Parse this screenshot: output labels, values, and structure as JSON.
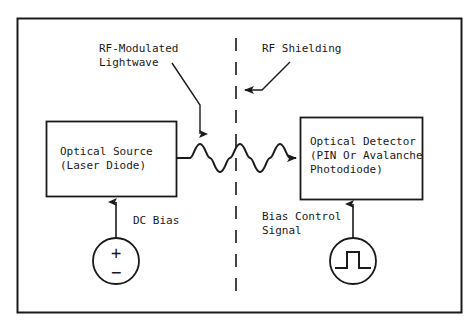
{
  "figure": {
    "type": "block-diagram",
    "frame": {
      "name": "outer-border",
      "color": "#1a1a1a"
    },
    "background_color": "#ffffff",
    "line_color": "#1a1a1a"
  },
  "blocks": [
    {
      "id": "optical-source",
      "lines": [
        "Optical Source",
        "(Laser Diode)"
      ],
      "x": 46,
      "y": 121,
      "w": 130,
      "h": 75
    },
    {
      "id": "optical-detector",
      "lines": [
        "Optical Detector",
        "(PIN Or Avalanche",
        "Photodiode)"
      ],
      "x": 300,
      "y": 117,
      "w": 122,
      "h": 82
    }
  ],
  "labels": {
    "rf_modulated_lightwave": [
      "RF-Modulated",
      "Lightwave"
    ],
    "rf_shielding": "RF Shielding",
    "dc_bias": "DC Bias",
    "bias_control_signal": [
      "Bias Control",
      "Signal"
    ]
  },
  "sources": [
    {
      "id": "dc-source",
      "symbol": "plus-minus",
      "plus": "+",
      "minus": "−",
      "cx": 116,
      "cy": 261,
      "r": 23,
      "feeds": "optical-source"
    },
    {
      "id": "pulse-source",
      "symbol": "square-pulse",
      "cx": 353,
      "cy": 261,
      "r": 23,
      "feeds": "optical-detector"
    }
  ],
  "shielding": {
    "id": "rf-shielding-line",
    "style": "dashed-vertical",
    "x": 236,
    "y_top": 38,
    "y_bottom": 298
  },
  "signal_path": {
    "id": "lightwave",
    "description": "sinusoidal modulated lightwave from source to detector",
    "cycles": 3.5,
    "amplitude": 14,
    "baseline_y": 158,
    "x_start": 176,
    "x_end": 300,
    "arrow": "right"
  }
}
